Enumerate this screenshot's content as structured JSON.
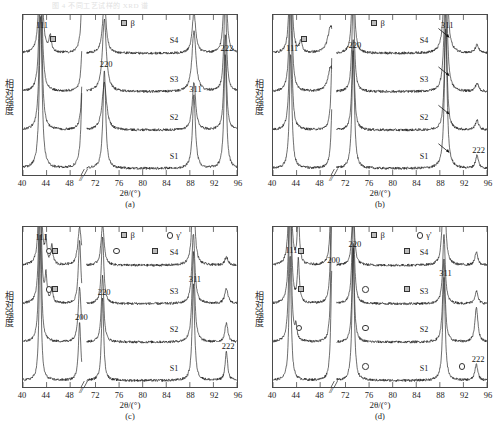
{
  "figure": {
    "top_caption_faded": "图 4  不同工艺试样的 XRD 谱",
    "axis": {
      "y_label": "相对强度",
      "x_label_html": "2θ/(°)",
      "x_label_prefix": "2",
      "x_label_theta": "θ",
      "x_label_suffix": "/(°)",
      "x_break_symbol": "//",
      "x_ticks": [
        40,
        44,
        48,
        72,
        76,
        80,
        84,
        88,
        92,
        96
      ],
      "x_range_left": [
        40,
        50
      ],
      "x_range_right": [
        70.5,
        96
      ]
    },
    "curve_labels": [
      "S1",
      "S2",
      "S3",
      "S4"
    ],
    "peak_labels": [
      "111",
      "200",
      "220",
      "311",
      "222"
    ],
    "legend_beta": "β",
    "legend_gamma_prime": "γ'",
    "marker_square_name": "beta-marker",
    "marker_circle_name": "gamma-prime-marker",
    "panel_labels": [
      "(a)",
      "(b)",
      "(c)",
      "(d)"
    ]
  },
  "chart_data": [
    {
      "id": "a",
      "type": "line",
      "title": "(a)",
      "xlabel": "2θ/(°)",
      "ylabel": "相对强度",
      "xlim": [
        40,
        96
      ],
      "ylim": [
        0,
        100
      ],
      "grid": false,
      "legend_position": "top-center",
      "legend": [
        "β"
      ],
      "axis_break": [
        50,
        70.5
      ],
      "series": [
        {
          "name": "S1",
          "offset": 4,
          "peaks": [
            {
              "x": 43.0,
              "h": 96,
              "w": 0.55,
              "label": "111"
            },
            {
              "x": 50.2,
              "h": 92,
              "w": 0.5,
              "label": "200"
            },
            {
              "x": 73.5,
              "h": 62,
              "w": 0.55,
              "label": "220"
            },
            {
              "x": 88.7,
              "h": 46,
              "w": 0.6,
              "label": "311"
            },
            {
              "x": 94.0,
              "h": 72,
              "w": 0.5,
              "label": "222"
            }
          ]
        },
        {
          "name": "S2",
          "offset": 28,
          "peaks": [
            {
              "x": 43.0,
              "h": 90,
              "w": 0.55
            },
            {
              "x": 50.2,
              "h": 52,
              "w": 0.5
            },
            {
              "x": 73.5,
              "h": 30,
              "w": 0.9
            },
            {
              "x": 88.7,
              "h": 30,
              "w": 0.7
            },
            {
              "x": 94.0,
              "h": 60,
              "w": 0.5
            }
          ]
        },
        {
          "name": "S3",
          "offset": 52,
          "peaks": [
            {
              "x": 43.0,
              "h": 88,
              "w": 0.55
            },
            {
              "x": 50.2,
              "h": 50,
              "w": 0.5
            },
            {
              "x": 73.5,
              "h": 45,
              "w": 0.8
            },
            {
              "x": 88.7,
              "h": 38,
              "w": 0.8
            },
            {
              "x": 94.0,
              "h": 62,
              "w": 0.5
            }
          ]
        },
        {
          "name": "S4",
          "offset": 76,
          "peaks": [
            {
              "x": 43.0,
              "h": 86,
              "w": 0.55
            },
            {
              "x": 44.6,
              "h": 10,
              "w": 0.5,
              "marker": "beta"
            },
            {
              "x": 50.2,
              "h": 70,
              "w": 0.5
            },
            {
              "x": 73.5,
              "h": 33,
              "w": 0.7
            },
            {
              "x": 88.7,
              "h": 26,
              "w": 0.7
            },
            {
              "x": 94.0,
              "h": 70,
              "w": 0.5
            }
          ]
        }
      ],
      "annotations": {
        "beta_markers": [
          {
            "series": "S4",
            "x": 44.6
          }
        ],
        "arrows": []
      }
    },
    {
      "id": "b",
      "type": "line",
      "title": "(b)",
      "xlabel": "2θ/(°)",
      "ylabel": "相对强度",
      "xlim": [
        40,
        96
      ],
      "ylim": [
        0,
        100
      ],
      "grid": false,
      "legend_position": "top-center",
      "legend": [
        "β"
      ],
      "axis_break": [
        50,
        70.5
      ],
      "series": [
        {
          "name": "S1",
          "offset": 4,
          "peaks": [
            {
              "x": 43.0,
              "h": 72,
              "w": 0.5,
              "label": "111"
            },
            {
              "x": 50.1,
              "h": 50,
              "w": 0.5,
              "label": "200"
            },
            {
              "x": 73.3,
              "h": 74,
              "w": 0.5,
              "label": "220"
            },
            {
              "x": 89.0,
              "h": 88,
              "w": 0.55,
              "label": "311"
            },
            {
              "x": 94.3,
              "h": 8,
              "w": 0.6,
              "label": "222"
            }
          ]
        },
        {
          "name": "S2",
          "offset": 28,
          "peaks": [
            {
              "x": 43.0,
              "h": 80,
              "w": 0.5
            },
            {
              "x": 50.1,
              "h": 64,
              "w": 0.45
            },
            {
              "x": 73.3,
              "h": 56,
              "w": 0.5
            },
            {
              "x": 89.0,
              "h": 76,
              "w": 0.5
            },
            {
              "x": 94.3,
              "h": 6,
              "w": 0.7
            }
          ]
        },
        {
          "name": "S3",
          "offset": 52,
          "peaks": [
            {
              "x": 43.0,
              "h": 82,
              "w": 0.5
            },
            {
              "x": 49.8,
              "h": 16,
              "w": 1.1
            },
            {
              "x": 73.3,
              "h": 58,
              "w": 0.5
            },
            {
              "x": 89.0,
              "h": 76,
              "w": 0.6
            },
            {
              "x": 94.3,
              "h": 5,
              "w": 0.7
            }
          ]
        },
        {
          "name": "S4",
          "offset": 76,
          "peaks": [
            {
              "x": 43.0,
              "h": 76,
              "w": 0.5
            },
            {
              "x": 44.7,
              "h": 7,
              "w": 0.5,
              "marker": "beta"
            },
            {
              "x": 49.8,
              "h": 17,
              "w": 1.2
            },
            {
              "x": 73.3,
              "h": 60,
              "w": 0.5
            },
            {
              "x": 89.0,
              "h": 86,
              "w": 0.6
            },
            {
              "x": 94.3,
              "h": 5,
              "w": 0.7
            }
          ]
        }
      ],
      "annotations": {
        "beta_markers": [
          {
            "series": "S4",
            "x": 44.7
          }
        ],
        "arrows": [
          {
            "series": "S1",
            "x": 88.1
          },
          {
            "series": "S2",
            "x": 88.1
          },
          {
            "series": "S3",
            "x": 88.1
          },
          {
            "series": "S4",
            "x": 88.1
          }
        ]
      }
    },
    {
      "id": "c",
      "type": "line",
      "title": "(c)",
      "xlabel": "2θ/(°)",
      "ylabel": "相对强度",
      "xlim": [
        40,
        96
      ],
      "ylim": [
        0,
        100
      ],
      "grid": false,
      "legend_position": "top-center",
      "legend": [
        "β",
        "γ'"
      ],
      "axis_break": [
        50,
        70.5
      ],
      "series": [
        {
          "name": "S1",
          "offset": 4,
          "peaks": [
            {
              "x": 42.9,
              "h": 92,
              "w": 0.4,
              "label": "111"
            },
            {
              "x": 49.6,
              "h": 36,
              "w": 0.5,
              "label": "200"
            },
            {
              "x": 73.2,
              "h": 52,
              "w": 0.45,
              "label": "220"
            },
            {
              "x": 88.6,
              "h": 60,
              "w": 0.5,
              "label": "311"
            },
            {
              "x": 94.2,
              "h": 18,
              "w": 0.5,
              "label": "222"
            }
          ]
        },
        {
          "name": "S2",
          "offset": 28,
          "peaks": [
            {
              "x": 42.9,
              "h": 94,
              "w": 0.45
            },
            {
              "x": 49.6,
              "h": 34,
              "w": 0.6
            },
            {
              "x": 73.2,
              "h": 42,
              "w": 0.5
            },
            {
              "x": 88.6,
              "h": 56,
              "w": 0.55
            },
            {
              "x": 94.2,
              "h": 12,
              "w": 0.6
            }
          ]
        },
        {
          "name": "S3",
          "offset": 52,
          "peaks": [
            {
              "x": 42.9,
              "h": 90,
              "w": 0.45
            },
            {
              "x": 43.9,
              "h": 16,
              "w": 0.4,
              "marker": "gamma"
            },
            {
              "x": 44.9,
              "h": 9,
              "w": 0.4,
              "marker": "beta"
            },
            {
              "x": 49.6,
              "h": 40,
              "w": 0.5
            },
            {
              "x": 73.2,
              "h": 42,
              "w": 0.5
            },
            {
              "x": 88.6,
              "h": 44,
              "w": 0.6
            },
            {
              "x": 94.2,
              "h": 9,
              "w": 0.7
            }
          ]
        },
        {
          "name": "S4",
          "offset": 76,
          "peaks": [
            {
              "x": 42.9,
              "h": 92,
              "w": 0.45
            },
            {
              "x": 43.9,
              "h": 14,
              "w": 0.4,
              "marker": "gamma"
            },
            {
              "x": 44.9,
              "h": 12,
              "w": 0.4,
              "marker": "beta"
            },
            {
              "x": 49.6,
              "h": 24,
              "w": 0.7
            },
            {
              "x": 73.2,
              "h": 26,
              "w": 0.6
            },
            {
              "x": 88.6,
              "h": 48,
              "w": 0.6
            },
            {
              "x": 94.2,
              "h": 5,
              "w": 0.7
            }
          ]
        }
      ],
      "annotations": {
        "beta_markers": [
          {
            "series": "S3",
            "x": 44.9
          },
          {
            "series": "S4",
            "x": 44.9
          },
          {
            "series": "S4",
            "x": 81.5
          }
        ],
        "gamma_markers": [
          {
            "series": "S3",
            "x": 43.9
          },
          {
            "series": "S4",
            "x": 43.9
          },
          {
            "series": "S4",
            "x": 75.0
          }
        ],
        "arrows": []
      }
    },
    {
      "id": "d",
      "type": "line",
      "title": "(d)",
      "xlabel": "2θ/(°)",
      "ylabel": "相对强度",
      "xlim": [
        40,
        96
      ],
      "ylim": [
        0,
        100
      ],
      "grid": false,
      "legend_position": "top-center",
      "legend": [
        "β",
        "γ'"
      ],
      "axis_break": [
        50,
        70.5
      ],
      "series": [
        {
          "name": "S1",
          "offset": 4,
          "peaks": [
            {
              "x": 42.9,
              "h": 78,
              "w": 0.45,
              "label": "111"
            },
            {
              "x": 50.0,
              "h": 72,
              "w": 0.45,
              "label": "200"
            },
            {
              "x": 73.3,
              "h": 82,
              "w": 0.45,
              "label": "220"
            },
            {
              "x": 88.7,
              "h": 64,
              "w": 0.5,
              "label": "311"
            },
            {
              "x": 94.2,
              "h": 10,
              "w": 0.6,
              "label": "222"
            }
          ]
        },
        {
          "name": "S2",
          "offset": 28,
          "peaks": [
            {
              "x": 42.9,
              "h": 96,
              "w": 0.45
            },
            {
              "x": 43.9,
              "h": 8,
              "w": 0.4,
              "marker": "gamma"
            },
            {
              "x": 50.0,
              "h": 90,
              "w": 0.4
            },
            {
              "x": 73.3,
              "h": 62,
              "w": 0.45
            },
            {
              "x": 88.7,
              "h": 52,
              "w": 0.5
            },
            {
              "x": 94.2,
              "h": 22,
              "w": 0.6
            }
          ]
        },
        {
          "name": "S3",
          "offset": 52,
          "peaks": [
            {
              "x": 42.9,
              "h": 94,
              "w": 0.45
            },
            {
              "x": 44.3,
              "h": 26,
              "w": 0.4,
              "marker": "beta"
            },
            {
              "x": 50.0,
              "h": 92,
              "w": 0.4
            },
            {
              "x": 73.3,
              "h": 56,
              "w": 0.5
            },
            {
              "x": 88.7,
              "h": 44,
              "w": 0.5
            },
            {
              "x": 94.2,
              "h": 8,
              "w": 0.6
            }
          ]
        },
        {
          "name": "S4",
          "offset": 76,
          "peaks": [
            {
              "x": 42.9,
              "h": 92,
              "w": 0.45
            },
            {
              "x": 44.3,
              "h": 34,
              "w": 0.4,
              "marker": "beta"
            },
            {
              "x": 50.0,
              "h": 94,
              "w": 0.4
            },
            {
              "x": 73.3,
              "h": 36,
              "w": 0.55
            },
            {
              "x": 88.7,
              "h": 72,
              "w": 0.5
            },
            {
              "x": 94.2,
              "h": 8,
              "w": 0.6
            }
          ]
        }
      ],
      "annotations": {
        "beta_markers": [
          {
            "series": "S3",
            "x": 44.3
          },
          {
            "series": "S4",
            "x": 44.3
          },
          {
            "series": "S3",
            "x": 82.0
          },
          {
            "series": "S4",
            "x": 82.0
          }
        ],
        "gamma_markers": [
          {
            "series": "S1",
            "x": 74.8
          },
          {
            "series": "S1",
            "x": 91.2
          },
          {
            "series": "S2",
            "x": 43.9
          },
          {
            "series": "S2",
            "x": 74.8
          },
          {
            "series": "S3",
            "x": 74.8
          }
        ],
        "arrows": []
      }
    }
  ]
}
